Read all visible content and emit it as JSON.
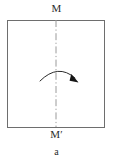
{
  "figure": {
    "caption": "a",
    "labels": {
      "mirror_top": "M",
      "mirror_bottom": "M′"
    },
    "colors": {
      "sheet_border": "#6e6e6e",
      "sheet_fill": "#ffffff",
      "fold_line": "#9a9a9a",
      "arrow": "#1a1a1a",
      "text": "#2b2b2b",
      "background": "#ffffff"
    },
    "geometry": {
      "sheet_x": 7,
      "sheet_y": 20,
      "sheet_width": 96,
      "sheet_height": 106,
      "fold_line_x": 56,
      "fold_line_top_y": 20,
      "fold_line_bottom_y": 127,
      "fold_line_style": "dash-dot",
      "arc_start_x": 40,
      "arc_start_y": 81,
      "arc_end_x": 76,
      "arc_end_y": 79,
      "arc_peak_y": 68
    },
    "icons": {
      "fold_arrow": "curved-arrow-icon",
      "fold_axis": "dash-dot-axis-icon"
    }
  }
}
